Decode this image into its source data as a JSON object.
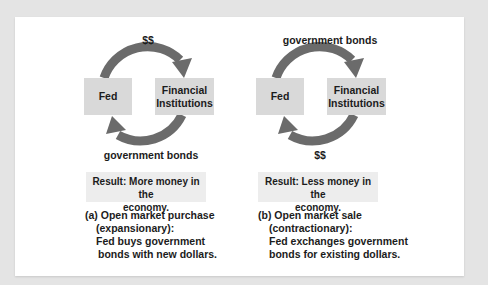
{
  "colors": {
    "background": "#e4e4e4",
    "panel": "#ffffff",
    "box_fill": "#d9d9d9",
    "result_fill": "#ededed",
    "arrow": "#6b6b6b",
    "text": "#1c1c1c"
  },
  "panels": [
    {
      "id": "a",
      "fed_label": "Fed",
      "institutions_label_1": "Financial",
      "institutions_label_2": "Institutions",
      "top_arrow_label": "$$",
      "bottom_arrow_label": "government bonds",
      "result_line1": "Result: More money in the",
      "result_line2": "economy.",
      "caption_line1": "(a) Open market purchase",
      "caption_line2": "(expansionary):",
      "caption_line3": "Fed buys government",
      "caption_line4": "bonds with new dollars."
    },
    {
      "id": "b",
      "fed_label": "Fed",
      "institutions_label_1": "Financial",
      "institutions_label_2": "Institutions",
      "top_arrow_label": "government bonds",
      "bottom_arrow_label": "$$",
      "result_line1": "Result: Less money in the",
      "result_line2": "economy.",
      "caption_line1": "(b) Open market sale",
      "caption_line2": "(contractionary):",
      "caption_line3": "Fed exchanges government",
      "caption_line4": "bonds for existing dollars."
    }
  ]
}
